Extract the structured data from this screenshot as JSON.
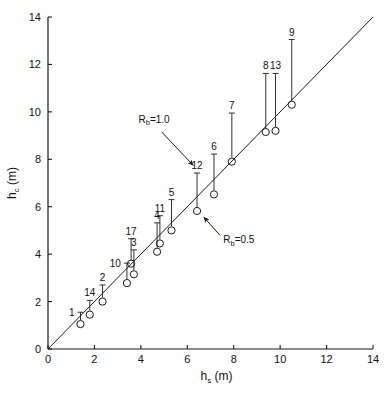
{
  "chart_data": {
    "type": "scatter",
    "title": "",
    "xlabel": "h_s (m)",
    "xlabel_base": "h",
    "xlabel_sub": "s",
    "xlabel_unit": " (m)",
    "ylabel": "h_c (m)",
    "ylabel_base": "h",
    "ylabel_sub": "c",
    "ylabel_unit": " (m)",
    "xlim": [
      0,
      14
    ],
    "ylim": [
      0,
      14
    ],
    "xticks": [
      0,
      2,
      4,
      6,
      8,
      10,
      12,
      14
    ],
    "yticks": [
      0,
      2,
      4,
      6,
      8,
      10,
      12,
      14
    ],
    "xtick_labels": [
      "0",
      "2",
      "4",
      "6",
      "8",
      "10",
      "12",
      "14"
    ],
    "ytick_labels": [
      "0",
      "2",
      "4",
      "6",
      "8",
      "10",
      "12",
      "14"
    ],
    "grid": false,
    "legend": "none",
    "reference_line": {
      "name": "one-to-one-line",
      "from": [
        0,
        0
      ],
      "to": [
        14,
        14
      ],
      "label": "R_b=1.0"
    },
    "marker": "open-circle",
    "errorbar_style": "upward-bar-with-cap",
    "points": [
      {
        "label": "1",
        "x": 1.4,
        "y": 1.05,
        "ytop": 1.55,
        "label_pos": "left"
      },
      {
        "label": "14",
        "x": 1.8,
        "y": 1.45,
        "ytop": 2.05,
        "label_pos": "top"
      },
      {
        "label": "2",
        "x": 2.35,
        "y": 2.0,
        "ytop": 2.7,
        "label_pos": "top"
      },
      {
        "label": "10",
        "x": 3.4,
        "y": 2.78,
        "ytop": 3.62,
        "label_pos": "left"
      },
      {
        "label": "3",
        "x": 3.7,
        "y": 3.15,
        "ytop": 4.18,
        "label_pos": "top"
      },
      {
        "label": "17",
        "x": 3.58,
        "y": 3.6,
        "ytop": 4.65,
        "label_pos": "top"
      },
      {
        "label": "4",
        "x": 4.7,
        "y": 4.1,
        "ytop": 5.32,
        "label_pos": "top"
      },
      {
        "label": "11",
        "x": 4.82,
        "y": 4.45,
        "ytop": 5.62,
        "label_pos": "top"
      },
      {
        "label": "5",
        "x": 5.32,
        "y": 5.0,
        "ytop": 6.3,
        "label_pos": "top"
      },
      {
        "label": "12",
        "x": 6.42,
        "y": 5.82,
        "ytop": 7.42,
        "label_pos": "top"
      },
      {
        "label": "6",
        "x": 7.15,
        "y": 6.52,
        "ytop": 8.22,
        "label_pos": "top"
      },
      {
        "label": "7",
        "x": 7.92,
        "y": 7.9,
        "ytop": 9.95,
        "label_pos": "top"
      },
      {
        "label": "8",
        "x": 9.38,
        "y": 9.15,
        "ytop": 11.62,
        "label_pos": "top"
      },
      {
        "label": "13",
        "x": 9.8,
        "y": 9.2,
        "ytop": 11.62,
        "label_pos": "top"
      },
      {
        "label": "9",
        "x": 10.5,
        "y": 10.3,
        "ytop": 13.05,
        "label_pos": "top"
      }
    ],
    "annotations": [
      {
        "name": "rb-1-0-annotation",
        "text": "R_b=1.0",
        "base": "R",
        "sub": "b",
        "rest": "=1.0",
        "text_xy": [
          3.9,
          9.55
        ],
        "arrow_from": [
          4.9,
          9.15
        ],
        "arrow_to": [
          6.25,
          7.75
        ]
      },
      {
        "name": "rb-0-5-annotation",
        "text": "R_b=0.5",
        "base": "R",
        "sub": "b",
        "rest": "=0.5",
        "text_xy": [
          7.55,
          4.45
        ],
        "arrow_from": [
          7.4,
          4.8
        ],
        "arrow_to": [
          6.72,
          5.55
        ]
      }
    ],
    "colors": {
      "axis": "#1a1a1a",
      "marker": "#1a1a1a",
      "line": "#1a1a1a",
      "background": "#ffffff",
      "text": "#111111"
    }
  }
}
